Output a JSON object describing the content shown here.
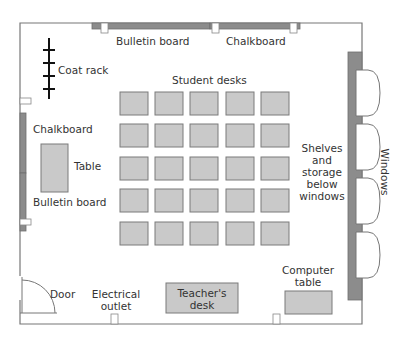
{
  "diagram": {
    "labels": {
      "bulletin_top": "Bulletin board",
      "chalkboard_top": "Chalkboard",
      "coat_rack": "Coat rack",
      "student_desks": "Student desks",
      "chalkboard_left": "Chalkboard",
      "table": "Table",
      "bulletin_left": "Bulletin board",
      "shelves_line1": "Shelves",
      "shelves_line2": "and",
      "shelves_line3": "storage",
      "shelves_line4": "below",
      "shelves_line5": "windows",
      "windows": "Windows",
      "door": "Door",
      "outlet_line1": "Electrical",
      "outlet_line2": "outlet",
      "teacher_line1": "Teacher's",
      "teacher_line2": "desk",
      "computer_line1": "Computer",
      "computer_line2": "table"
    },
    "student_desk_grid": {
      "rows": 5,
      "columns": 5
    },
    "colors": {
      "furniture": "#c9c9c9",
      "boards": "#8c8c8c",
      "walls": "#777777"
    }
  }
}
